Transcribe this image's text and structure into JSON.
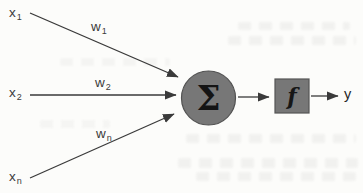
{
  "diagram": {
    "inputs": [
      {
        "base": "x",
        "sub": "1"
      },
      {
        "base": "x",
        "sub": "2"
      },
      {
        "base": "x",
        "sub": "n"
      }
    ],
    "weights": [
      {
        "base": "w",
        "sub": "1"
      },
      {
        "base": "w",
        "sub": "2"
      },
      {
        "base": "w",
        "sub": "n"
      }
    ],
    "summation_symbol": "Σ",
    "activation_symbol": "f",
    "output_label": "y",
    "colors": {
      "node_fill": "#777777",
      "arrow": "#3a3a3a",
      "label_text": "#3b3b3b",
      "paper": "#fcfcfa"
    }
  }
}
